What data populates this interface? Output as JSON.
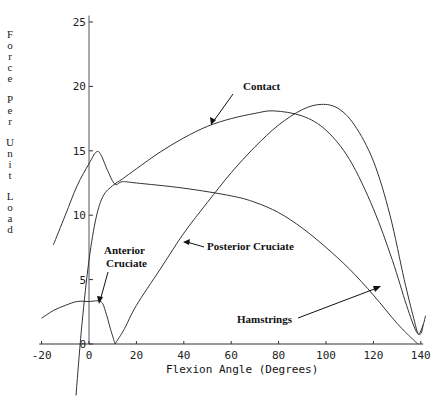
{
  "chart_data": {
    "type": "line",
    "title": "",
    "xlabel": "Flexion Angle (Degrees)",
    "ylabel": "Force Per Unit Load",
    "xlim": [
      -20,
      140
    ],
    "ylim": [
      0,
      25
    ],
    "x_ticks": [
      -20,
      0,
      20,
      40,
      60,
      80,
      100,
      120,
      140
    ],
    "y_ticks": [
      0,
      5,
      10,
      15,
      20,
      25
    ],
    "grid": false,
    "legend": "none (curves annotated with arrows)",
    "series": [
      {
        "name": "Contact",
        "points": [
          [
            -5.5,
            -4
          ],
          [
            -3,
            1.5
          ],
          [
            0,
            6.5
          ],
          [
            3,
            9.8
          ],
          [
            6,
            11.5
          ],
          [
            10,
            12.3
          ],
          [
            14,
            12.8
          ],
          [
            20,
            13.6
          ],
          [
            30,
            14.9
          ],
          [
            40,
            16.0
          ],
          [
            50,
            16.9
          ],
          [
            60,
            17.5
          ],
          [
            70,
            17.9
          ],
          [
            78,
            18.1
          ],
          [
            90,
            17.7
          ],
          [
            100,
            16.6
          ],
          [
            110,
            14.3
          ],
          [
            120,
            10.5
          ],
          [
            128,
            6.5
          ],
          [
            134,
            3.0
          ],
          [
            138,
            1.0
          ],
          [
            140,
            0.8
          ],
          [
            141,
            1.5
          ]
        ]
      },
      {
        "name": "Hamstrings",
        "points": [
          [
            -15,
            7.7
          ],
          [
            -10,
            10.0
          ],
          [
            -5,
            12.3
          ],
          [
            0,
            14.0
          ],
          [
            3,
            14.9
          ],
          [
            5,
            14.7
          ],
          [
            8,
            13.4
          ],
          [
            11,
            12.4
          ],
          [
            14,
            12.6
          ],
          [
            20,
            12.5
          ],
          [
            40,
            12.1
          ],
          [
            60,
            11.5
          ],
          [
            70,
            11.0
          ],
          [
            80,
            10.2
          ],
          [
            90,
            9.0
          ],
          [
            100,
            7.5
          ],
          [
            110,
            5.8
          ],
          [
            120,
            3.8
          ],
          [
            130,
            1.6
          ],
          [
            137,
            0.3
          ],
          [
            139,
            0
          ]
        ]
      },
      {
        "name": "Posterior Cruciate",
        "points": [
          [
            11,
            0
          ],
          [
            15,
            1.2
          ],
          [
            20,
            3.0
          ],
          [
            30,
            5.8
          ],
          [
            40,
            8.6
          ],
          [
            50,
            11.0
          ],
          [
            60,
            13.3
          ],
          [
            70,
            15.3
          ],
          [
            80,
            17.0
          ],
          [
            90,
            18.2
          ],
          [
            98,
            18.6
          ],
          [
            105,
            18.3
          ],
          [
            112,
            17.0
          ],
          [
            120,
            14.2
          ],
          [
            127,
            10.0
          ],
          [
            133,
            5.0
          ],
          [
            137,
            2.0
          ],
          [
            139,
            0.8
          ],
          [
            141,
            1.5
          ],
          [
            142,
            2.2
          ]
        ]
      },
      {
        "name": "Anterior Cruciate",
        "points": [
          [
            -20,
            2.0
          ],
          [
            -15,
            2.6
          ],
          [
            -10,
            3.0
          ],
          [
            -5,
            3.3
          ],
          [
            0,
            3.3
          ],
          [
            5,
            3.3
          ],
          [
            7,
            2.5
          ],
          [
            9,
            1.2
          ],
          [
            11,
            0
          ]
        ]
      }
    ],
    "annotations": [
      "Contact",
      "Posterior Cruciate",
      "Anterior Cruciate",
      "Hamstrings"
    ]
  },
  "axes": {
    "x_title": "Flexion Angle (Degrees)",
    "y_title_chars": [
      "F",
      "o",
      "r",
      "c",
      "e",
      "",
      "P",
      "e",
      "r",
      "",
      "U",
      "n",
      "i",
      "t",
      "",
      "L",
      "o",
      "a",
      "d"
    ],
    "x_tick_labels": [
      "-20",
      "0",
      "20",
      "40",
      "60",
      "80",
      "100",
      "120",
      "140"
    ],
    "y_tick_labels": [
      "0",
      "5",
      "10",
      "15",
      "20",
      "25"
    ]
  },
  "labels": {
    "contact": "Contact",
    "posterior": "Posterior Cruciate",
    "anterior_1": "Anterior",
    "anterior_2": "Cruciate",
    "hamstrings": "Hamstrings"
  }
}
